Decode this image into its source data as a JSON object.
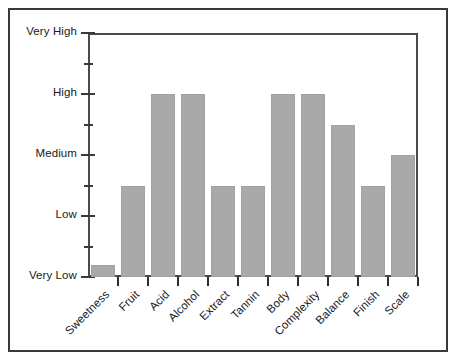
{
  "chart_data": {
    "type": "bar",
    "title": "",
    "subtitle": "",
    "xlabel": "",
    "ylabel": "",
    "categories": [
      "Sweetness",
      "Fruit",
      "Acid",
      "Alcohol",
      "Extract",
      "Tannin",
      "Body",
      "Complexity",
      "Balance",
      "Finish",
      "Scale"
    ],
    "values": [
      0.2,
      1.5,
      3.0,
      3.0,
      1.5,
      1.5,
      3.0,
      3.0,
      2.5,
      1.5,
      2.0
    ],
    "value_labels": [
      "just above Very Low",
      "between Low and Medium",
      "High",
      "High",
      "between Low and Medium",
      "between Low and Medium",
      "High",
      "High",
      "between Medium and High",
      "between Low and Medium",
      "Medium"
    ],
    "ytick_labels": [
      "Very Low",
      "Low",
      "Medium",
      "High",
      "Very High"
    ],
    "ytick_values": [
      0,
      1,
      2,
      3,
      4
    ],
    "yminor_ticks": [
      0.5,
      1.5,
      2.5,
      3.5
    ],
    "ylim": [
      0,
      4
    ],
    "grid": false,
    "legend": null,
    "bar_color": "#a9a9a9",
    "axis_color": "#3a3a3a",
    "frame_color": "#3a3a3a",
    "background": "#ffffff"
  }
}
